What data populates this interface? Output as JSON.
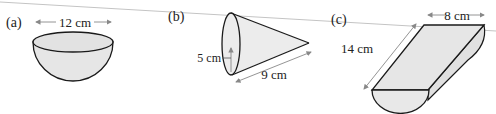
{
  "figures": [
    {
      "id": "a",
      "label": "(a)",
      "shape": "hemisphere",
      "dimension": "12 cm"
    },
    {
      "id": "b",
      "label": "(b)",
      "shape": "cone",
      "dimension_radius": "5 cm",
      "dimension_slant": "9 cm"
    },
    {
      "id": "c",
      "label": "(c)",
      "shape": "half-cylinder",
      "dimension_diameter": "8 cm",
      "dimension_length": "14 cm"
    }
  ],
  "colors": {
    "fill": "#e6e6e6",
    "stroke": "#1a1a1a",
    "arrow": "#888888",
    "rule": "#bdbdbd"
  }
}
